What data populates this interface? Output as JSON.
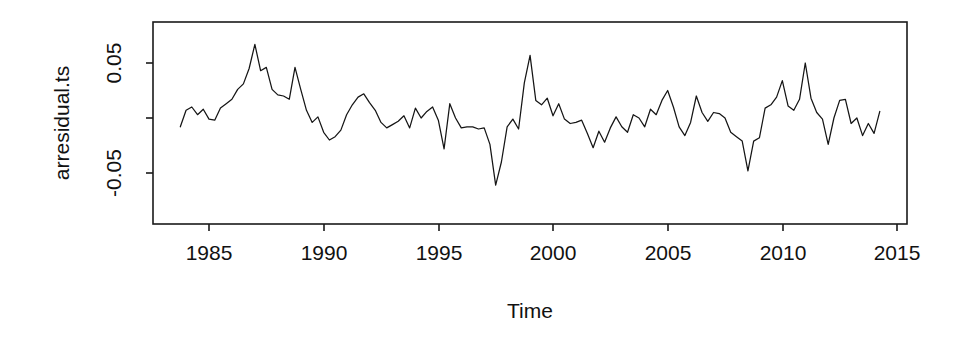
{
  "chart_data": {
    "type": "line",
    "title": "",
    "xlabel": "Time",
    "ylabel": "arresidual.ts",
    "xlim": [
      1983.3,
      2014.9
    ],
    "ylim": [
      -0.105,
      0.083
    ],
    "grid": false,
    "legend": "none",
    "xticks": [
      1985,
      1990,
      1995,
      2000,
      2005,
      2010,
      2015
    ],
    "xtick_labels": [
      "1985",
      "1990",
      "1995",
      "2000",
      "2005",
      "2010",
      "2015"
    ],
    "yticks": [
      0.05,
      0.0,
      -0.05
    ],
    "ytick_labels": [
      "0.05",
      "",
      "-0.05"
    ],
    "line_color": "#151515",
    "series": [
      {
        "name": "arresidual.ts",
        "x": [
          1983.75,
          1984.0,
          1984.25,
          1984.5,
          1984.75,
          1985.0,
          1985.25,
          1985.5,
          1985.75,
          1986.0,
          1986.25,
          1986.5,
          1986.75,
          1987.0,
          1987.25,
          1987.5,
          1987.75,
          1988.0,
          1988.25,
          1988.5,
          1988.75,
          1989.0,
          1989.25,
          1989.5,
          1989.75,
          1990.0,
          1990.25,
          1990.5,
          1990.75,
          1991.0,
          1991.25,
          1991.5,
          1991.75,
          1992.0,
          1992.25,
          1992.5,
          1992.75,
          1993.0,
          1993.25,
          1993.5,
          1993.75,
          1994.0,
          1994.25,
          1994.5,
          1994.75,
          1995.0,
          1995.25,
          1995.5,
          1995.75,
          1996.0,
          1996.25,
          1996.5,
          1996.75,
          1997.0,
          1997.25,
          1997.5,
          1997.75,
          1998.0,
          1998.25,
          1998.5,
          1998.75,
          1999.0,
          1999.25,
          1999.5,
          1999.75,
          2000.0,
          2000.25,
          2000.5,
          2000.75,
          2001.0,
          2001.25,
          2001.5,
          2001.75,
          2002.0,
          2002.25,
          2002.5,
          2002.75,
          2003.0,
          2003.25,
          2003.5,
          2003.75,
          2004.0,
          2004.25,
          2004.5,
          2004.75,
          2005.0,
          2005.25,
          2005.5,
          2005.75,
          2006.0,
          2006.25,
          2006.5,
          2006.75,
          2007.0,
          2007.25,
          2007.5,
          2007.75,
          2008.0,
          2008.25,
          2008.5,
          2008.75,
          2009.0,
          2009.25,
          2009.5,
          2009.75,
          2010.0,
          2010.25,
          2010.5,
          2010.75,
          2011.0,
          2011.25,
          2011.5,
          2011.75,
          2012.0,
          2012.25,
          2012.5,
          2012.75,
          2013.0,
          2013.25,
          2013.5,
          2013.75,
          2014.0,
          2014.25
        ],
        "y": [
          -0.008,
          0.007,
          0.01,
          0.003,
          0.008,
          -0.001,
          -0.002,
          0.009,
          0.013,
          0.017,
          0.026,
          0.031,
          0.045,
          0.067,
          0.043,
          0.046,
          0.026,
          0.021,
          0.02,
          0.017,
          0.046,
          0.026,
          0.007,
          -0.004,
          0.001,
          -0.013,
          -0.02,
          -0.017,
          -0.011,
          0.003,
          0.012,
          0.019,
          0.022,
          0.014,
          0.007,
          -0.004,
          -0.009,
          -0.006,
          -0.003,
          0.002,
          -0.009,
          0.009,
          0.0,
          0.006,
          0.01,
          -0.002,
          -0.028,
          0.013,
          0.0,
          -0.009,
          -0.008,
          -0.008,
          -0.01,
          -0.009,
          -0.024,
          -0.061,
          -0.04,
          -0.008,
          -0.001,
          -0.01,
          0.032,
          0.057,
          0.016,
          0.012,
          0.018,
          0.002,
          0.013,
          -0.001,
          -0.005,
          -0.004,
          -0.002,
          -0.014,
          -0.027,
          -0.012,
          -0.022,
          -0.009,
          0.001,
          -0.008,
          -0.013,
          0.003,
          0.0,
          -0.008,
          0.008,
          0.003,
          0.016,
          0.025,
          0.01,
          -0.008,
          -0.016,
          -0.004,
          0.02,
          0.005,
          -0.003,
          0.005,
          0.004,
          0.0,
          -0.013,
          -0.017,
          -0.021,
          -0.048,
          -0.021,
          -0.018,
          0.009,
          0.012,
          0.019,
          0.034,
          0.011,
          0.007,
          0.017,
          0.05,
          0.018,
          0.005,
          -0.001,
          -0.024,
          0.0,
          0.016,
          0.017,
          -0.005,
          0.0,
          -0.016,
          -0.005,
          -0.014,
          0.006
        ]
      }
    ]
  },
  "axis": {
    "ylabel": "arresidual.ts",
    "xlabel": "Time"
  }
}
